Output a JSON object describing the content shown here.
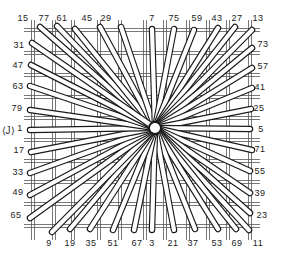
{
  "diagram": {
    "type": "radiating spoke weave diagram",
    "center": [
      155,
      128
    ],
    "side_label": "⟨J⟩",
    "grid": {
      "x_double_lines": [
        33,
        54,
        73,
        99,
        120,
        145,
        165,
        188,
        208,
        228,
        250
      ],
      "y_double_lines": [
        30,
        53,
        75,
        97,
        118,
        140,
        161,
        182,
        204,
        226
      ],
      "x_range": [
        30,
        252
      ],
      "y_range": [
        26,
        232
      ]
    },
    "spokes": [
      {
        "label": "15",
        "label_pos": [
          23,
          18
        ],
        "end": [
          40,
          27
        ]
      },
      {
        "label": "77",
        "label_pos": [
          44,
          18
        ],
        "end": [
          57,
          26
        ]
      },
      {
        "label": "61",
        "label_pos": [
          62,
          18
        ],
        "end": [
          75,
          29
        ]
      },
      {
        "label": "45",
        "label_pos": [
          87,
          18
        ],
        "end": [
          100,
          27
        ]
      },
      {
        "label": "29",
        "label_pos": [
          106,
          18
        ],
        "end": [
          121,
          27
        ]
      },
      {
        "label": "7",
        "label_pos": [
          152,
          18
        ],
        "end": [
          152,
          29
        ]
      },
      {
        "label": "75",
        "label_pos": [
          174,
          18
        ],
        "end": [
          174,
          29
        ]
      },
      {
        "label": "59",
        "label_pos": [
          197,
          18
        ],
        "end": [
          194,
          30
        ]
      },
      {
        "label": "43",
        "label_pos": [
          217,
          18
        ],
        "end": [
          218,
          28
        ]
      },
      {
        "label": "27",
        "label_pos": [
          237,
          18
        ],
        "end": [
          235,
          27
        ]
      },
      {
        "label": "13",
        "label_pos": [
          258,
          18
        ],
        "end": [
          252,
          30
        ]
      },
      {
        "label": "73",
        "label_pos": [
          263,
          44
        ],
        "end": [
          252,
          48
        ]
      },
      {
        "label": "57",
        "label_pos": [
          263,
          66
        ],
        "end": [
          252,
          68
        ]
      },
      {
        "label": "41",
        "label_pos": [
          260,
          87
        ],
        "end": [
          252,
          88
        ]
      },
      {
        "label": "25",
        "label_pos": [
          259,
          108
        ],
        "end": [
          251,
          109
        ]
      },
      {
        "label": "5",
        "label_pos": [
          261,
          129
        ],
        "end": [
          250,
          129
        ]
      },
      {
        "label": "71",
        "label_pos": [
          260,
          149
        ],
        "end": [
          252,
          150
        ]
      },
      {
        "label": "55",
        "label_pos": [
          260,
          171
        ],
        "end": [
          250,
          171
        ]
      },
      {
        "label": "39",
        "label_pos": [
          260,
          193
        ],
        "end": [
          250,
          193
        ]
      },
      {
        "label": "23",
        "label_pos": [
          262,
          215
        ],
        "end": [
          250,
          213
        ]
      },
      {
        "label": "11",
        "label_pos": [
          258,
          243
        ],
        "end": [
          249,
          230
        ]
      },
      {
        "label": "69",
        "label_pos": [
          237,
          243
        ],
        "end": [
          236,
          229
        ]
      },
      {
        "label": "53",
        "label_pos": [
          217,
          243
        ],
        "end": [
          218,
          229
        ]
      },
      {
        "label": "37",
        "label_pos": [
          193,
          243
        ],
        "end": [
          195,
          229
        ]
      },
      {
        "label": "21",
        "label_pos": [
          173,
          243
        ],
        "end": [
          174,
          230
        ]
      },
      {
        "label": "3",
        "label_pos": [
          152,
          243
        ],
        "end": [
          152,
          230
        ]
      },
      {
        "label": "67",
        "label_pos": [
          137,
          243
        ],
        "end": [
          134,
          230
        ]
      },
      {
        "label": "51",
        "label_pos": [
          113,
          243
        ],
        "end": [
          113,
          230
        ]
      },
      {
        "label": "35",
        "label_pos": [
          91,
          243
        ],
        "end": [
          90,
          229
        ]
      },
      {
        "label": "19",
        "label_pos": [
          70,
          243
        ],
        "end": [
          70,
          229
        ]
      },
      {
        "label": "9",
        "label_pos": [
          49,
          243
        ],
        "end": [
          52,
          232
        ]
      },
      {
        "label": "65",
        "label_pos": [
          16,
          215
        ],
        "end": [
          30,
          218
        ]
      },
      {
        "label": "49",
        "label_pos": [
          18,
          192
        ],
        "end": [
          30,
          195
        ]
      },
      {
        "label": "33",
        "label_pos": [
          18,
          172
        ],
        "end": [
          30,
          173
        ]
      },
      {
        "label": "17",
        "label_pos": [
          19,
          150
        ],
        "end": [
          31,
          152
        ]
      },
      {
        "label": "1",
        "label_pos": [
          20,
          128
        ],
        "end": [
          30,
          130
        ]
      },
      {
        "label": "79",
        "label_pos": [
          17,
          108
        ],
        "end": [
          30,
          110
        ]
      },
      {
        "label": "63",
        "label_pos": [
          18,
          86
        ],
        "end": [
          30,
          86
        ]
      },
      {
        "label": "47",
        "label_pos": [
          18,
          65
        ],
        "end": [
          31,
          65
        ]
      },
      {
        "label": "31",
        "label_pos": [
          19,
          45
        ],
        "end": [
          32,
          43
        ]
      }
    ],
    "colors": {
      "line": "#1a1a1a",
      "rod_fill": "#ffffff",
      "grid": "#555555",
      "background": "#ffffff"
    }
  }
}
